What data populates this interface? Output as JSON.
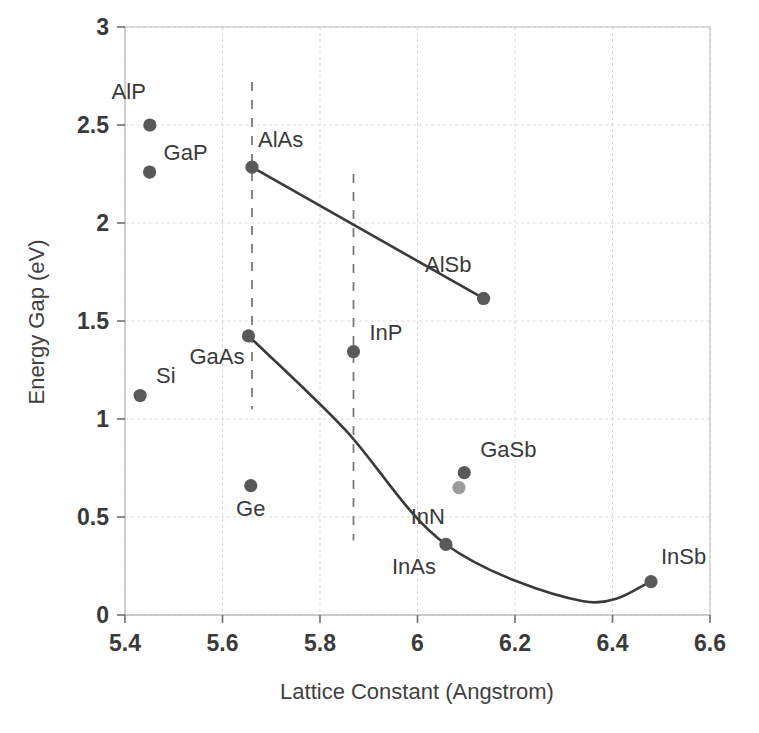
{
  "chart_data": {
    "type": "scatter",
    "title": "",
    "xlabel": "Lattice Constant (Angstrom)",
    "ylabel": "Energy Gap (eV)",
    "xlim": [
      5.4,
      6.6
    ],
    "ylim": [
      0,
      3
    ],
    "xticks": [
      "5.4",
      "5.6",
      "5.8",
      "6",
      "6.2",
      "6.4",
      "6.6"
    ],
    "xtick_values": [
      5.4,
      5.6,
      5.8,
      6.0,
      6.2,
      6.4,
      6.6
    ],
    "yticks": [
      "0",
      "0.5",
      "1",
      "1.5",
      "2",
      "2.5",
      "3"
    ],
    "ytick_values": [
      0,
      0.5,
      1,
      1.5,
      2,
      2.5,
      3
    ],
    "grid": true,
    "legend": "none",
    "point_color": "#595959",
    "point_color_light": "#9a9a9a",
    "line_color": "#3a3a3a",
    "grid_color": "#d8d8d8",
    "axis_color": "#bdbdbd",
    "points": [
      {
        "name": "AlP",
        "x": 5.451,
        "y": 2.5,
        "label_dx": -4,
        "label_dy": -26,
        "color": "#595959"
      },
      {
        "name": "GaP",
        "x": 5.4505,
        "y": 2.26,
        "label_dx": 14,
        "label_dy": -12,
        "color": "#595959"
      },
      {
        "name": "AlAs",
        "x": 5.6605,
        "y": 2.285,
        "label_dx": 6,
        "label_dy": -20,
        "color": "#595959"
      },
      {
        "name": "GaAs",
        "x": 5.6533,
        "y": 1.424,
        "label_dx": -4,
        "label_dy": 28,
        "color": "#595959"
      },
      {
        "name": "AlSb",
        "x": 6.1355,
        "y": 1.615,
        "label_dx": -12,
        "label_dy": -26,
        "color": "#595959"
      },
      {
        "name": "InP",
        "x": 5.8687,
        "y": 1.344,
        "label_dx": 16,
        "label_dy": -12,
        "color": "#595959"
      },
      {
        "name": "Si",
        "x": 5.431,
        "y": 1.12,
        "label_dx": 16,
        "label_dy": -12,
        "color": "#595959"
      },
      {
        "name": "Ge",
        "x": 5.658,
        "y": 0.66,
        "label_dx": 0,
        "label_dy": 30,
        "color": "#595959"
      },
      {
        "name": "GaSb",
        "x": 6.0959,
        "y": 0.726,
        "label_dx": 16,
        "label_dy": -16,
        "color": "#595959"
      },
      {
        "name": "InN",
        "x": 6.085,
        "y": 0.65,
        "label_dx": -14,
        "label_dy": 36,
        "color": "#9a9a9a"
      },
      {
        "name": "InAs",
        "x": 6.0583,
        "y": 0.36,
        "label_dx": -10,
        "label_dy": 30,
        "color": "#595959"
      },
      {
        "name": "InSb",
        "x": 6.479,
        "y": 0.17,
        "label_dx": 10,
        "label_dy": -18,
        "color": "#595959"
      }
    ],
    "series": [
      {
        "name": "AlAs-AlSb alloy line",
        "style": "solid",
        "points": [
          [
            5.6605,
            2.285
          ],
          [
            6.1355,
            1.615
          ]
        ]
      },
      {
        "name": "GaAs-InAs-InSb alloy curve",
        "style": "curve",
        "points": [
          [
            5.6533,
            1.424
          ],
          [
            5.85,
            0.95
          ],
          [
            6.0583,
            0.36
          ],
          [
            6.34,
            0.07
          ],
          [
            6.479,
            0.17
          ]
        ]
      }
    ],
    "vlines": [
      {
        "name": "lattice-match-5.66",
        "x": 5.6605,
        "y_from": 1.05,
        "y_to": 2.72,
        "style": "dashed"
      },
      {
        "name": "lattice-match-5.87",
        "x": 5.8687,
        "y_from": 0.38,
        "y_to": 2.25,
        "style": "dashed"
      }
    ]
  }
}
